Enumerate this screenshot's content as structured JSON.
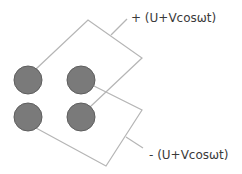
{
  "diagram": {
    "type": "quadrupole electrode schematic",
    "electrodes": [
      {
        "id": "top-left",
        "cx": 28,
        "cy": 80,
        "r": 14
      },
      {
        "id": "top-right",
        "cx": 81,
        "cy": 80,
        "r": 14
      },
      {
        "id": "bottom-left",
        "cx": 28,
        "cy": 117,
        "r": 14
      },
      {
        "id": "bottom-right",
        "cx": 81,
        "cy": 117,
        "r": 14
      }
    ],
    "colors": {
      "electrode_fill": "#7a7a7a",
      "electrode_stroke": "#5e5e5e",
      "wire": "#b5b5b5",
      "text": "#3a3a3a"
    },
    "labels": {
      "positive": "+ (U+Vcosωt)",
      "negative": "- (U+Vcosωt)"
    }
  }
}
